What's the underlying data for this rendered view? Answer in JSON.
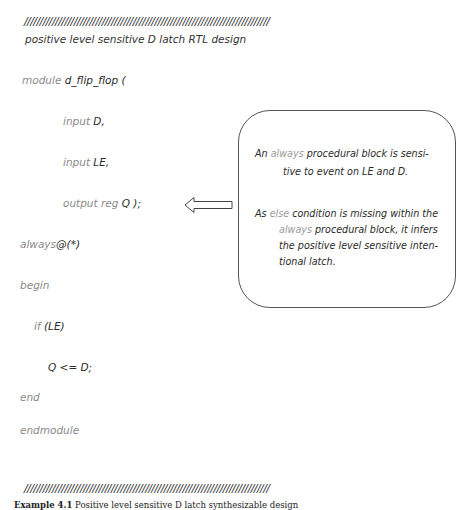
{
  "header": {
    "slashes": "///////////////////////////////////////////////////////////////////////////////",
    "title": "positive level sensitive D latch RTL design"
  },
  "code": {
    "lines": [
      {
        "keyword": "module",
        "text": "d_flip_flop ("
      },
      {
        "keyword": "input",
        "text": "D,"
      },
      {
        "keyword": "input",
        "text": "LE,"
      },
      {
        "keyword": "output reg",
        "text": "Q  );"
      },
      {
        "keyword": "always",
        "text": "@(*)"
      },
      {
        "keyword": "begin",
        "text": ""
      },
      {
        "keyword": "if",
        "text": "(LE)"
      },
      {
        "keyword": "",
        "text": "Q <=  D;"
      },
      {
        "keyword": "end",
        "text": ""
      },
      {
        "keyword": "endmodule",
        "text": ""
      }
    ]
  },
  "callout": {
    "note1": {
      "line1_pre": "An ",
      "line1_kw": "always",
      "line1_post": "  procedural  block is sensi-",
      "line2": "tive to event on LE and D."
    },
    "note2": {
      "line1_pre": "As ",
      "line1_kw": "else",
      "line1_post": " condition is missing within the",
      "line2_kw": "always",
      "line2_post": " procedural block, it infers",
      "line3": "the positive level sensitive  inten-",
      "line4": "tional latch."
    },
    "arrow_direction": "left"
  },
  "footer": {
    "slashes": "///////////////////////////////////////////////////////////////////////////////",
    "caption_label": "Example 4.1",
    "caption_text": "Positive level sensitive D latch synthesizable design"
  }
}
